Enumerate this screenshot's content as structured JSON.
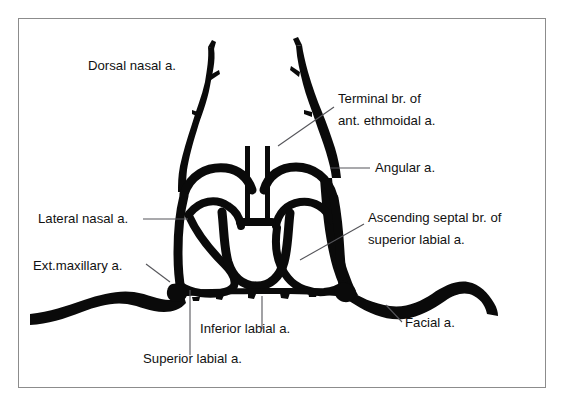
{
  "figure": {
    "border_color": "#8c8c8c",
    "background_color": "#ffffff",
    "artery_color": "#0a0a0a",
    "leader_color": "#55555a"
  },
  "labels": [
    {
      "id": "dorsal-nasal",
      "lines": [
        "Dorsal nasal a."
      ],
      "anchor": "start",
      "x": 88,
      "y": 70
    },
    {
      "id": "terminal-ant-ethmoidal",
      "lines": [
        "Terminal br. of",
        "ant. ethmoidal a."
      ],
      "anchor": "start",
      "x": 338,
      "y": 103
    },
    {
      "id": "angular",
      "lines": [
        "Angular a."
      ],
      "anchor": "start",
      "x": 375,
      "y": 172
    },
    {
      "id": "lateral-nasal",
      "lines": [
        "Lateral nasal a."
      ],
      "anchor": "start",
      "x": 38,
      "y": 223
    },
    {
      "id": "ascending-septal",
      "lines": [
        "Ascending septal br. of",
        "superior labial a."
      ],
      "anchor": "start",
      "x": 368,
      "y": 222
    },
    {
      "id": "ext-maxillary",
      "lines": [
        "Ext.maxillary a."
      ],
      "anchor": "start",
      "x": 33,
      "y": 270
    },
    {
      "id": "facial",
      "lines": [
        "Facial a."
      ],
      "anchor": "start",
      "x": 405,
      "y": 327
    },
    {
      "id": "inferior-labial",
      "lines": [
        "Inferior labial a."
      ],
      "anchor": "start",
      "x": 200,
      "y": 333
    },
    {
      "id": "superior-labial",
      "lines": [
        "Superior labial a."
      ],
      "anchor": "start",
      "x": 143,
      "y": 363
    }
  ],
  "leaders": [
    {
      "id": "leader-terminal-ant-ethmoidal",
      "d": "M 334 107 L 278 146"
    },
    {
      "id": "leader-angular",
      "d": "M 370 168 L 330 168"
    },
    {
      "id": "leader-lateral-nasal",
      "d": "M 143 219 L 188 219"
    },
    {
      "id": "leader-ascending-septal",
      "d": "M 364 224 L 300 260"
    },
    {
      "id": "leader-ext-maxillary",
      "d": "M 146 264 L 170 282"
    },
    {
      "id": "leader-facial",
      "d": "M 402 322 L 386 305"
    },
    {
      "id": "leader-inferior-labial",
      "d": "M 262 329 L 262 296"
    },
    {
      "id": "leader-superior-labial",
      "d": "M 190 355 L 190 290"
    }
  ],
  "vessels": [
    {
      "id": "dorsal-nasal-left",
      "name": "dorsal nasal artery (left)"
    },
    {
      "id": "dorsal-nasal-right",
      "name": "dorsal nasal artery (right) / angular a."
    },
    {
      "id": "terminal-ant-ethmoidal-branches",
      "name": "terminal branches of anterior ethmoidal artery"
    },
    {
      "id": "lateral-nasal-arch-left",
      "name": "lateral nasal artery arch (left)"
    },
    {
      "id": "lateral-nasal-arch-right",
      "name": "lateral nasal artery arch (right)"
    },
    {
      "id": "alar-loop-left",
      "name": "alar vascular loop (left)"
    },
    {
      "id": "alar-loop-right",
      "name": "alar vascular loop (right)"
    },
    {
      "id": "columellar-loop",
      "name": "columellar / ascending septal loop"
    },
    {
      "id": "facial-artery-left",
      "name": "facial (external maxillary) artery, left"
    },
    {
      "id": "facial-artery-right",
      "name": "facial artery, right"
    },
    {
      "id": "labial-band",
      "name": "superior and inferior labial artery band"
    }
  ]
}
